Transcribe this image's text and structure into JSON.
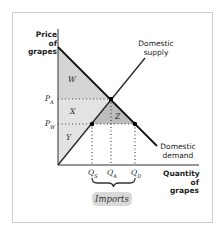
{
  "diagram": {
    "y_axis_label": "Price of grapes",
    "y_axis_label_line1": "Price of",
    "y_axis_label_line2": "grapes",
    "x_axis_label_line1": "Quantity",
    "x_axis_label_line2": "of grapes",
    "curves": {
      "supply_line1": "Domestic",
      "supply_line2": "supply",
      "demand_line1": "Domestic",
      "demand_line2": "demand"
    },
    "price_ticks": {
      "autarky": "P",
      "autarky_sub": "A",
      "world": "P",
      "world_sub": "W"
    },
    "quantity_ticks": {
      "q1": "Q",
      "q1_sub": "S",
      "qa": "Q",
      "qa_sub": "A",
      "qd": "Q",
      "qd_sub": "D"
    },
    "areas": {
      "w": "W",
      "x": "X",
      "y": "Y",
      "z": "Z"
    },
    "bracket_label": "Imports",
    "colors": {
      "shade_light": "#e6e6e6",
      "shade_mid": "#d2d2d2",
      "shade_dark": "#bdbdbd",
      "line": "#1a1a1a",
      "supply_line": "#2a2a2a"
    }
  }
}
